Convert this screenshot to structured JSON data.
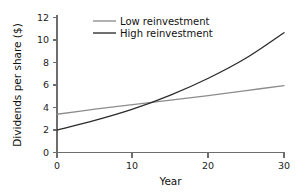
{
  "figure": {
    "width": 308,
    "height": 193,
    "background": "#ffffff"
  },
  "chart_data": {
    "type": "line",
    "title": "",
    "subtitle": "",
    "xlabel": "Year",
    "ylabel": "Dividends per share ($)",
    "xlim": [
      0,
      30
    ],
    "ylim": [
      0,
      12
    ],
    "xticks": [
      0,
      10,
      20,
      30
    ],
    "xtick_labels": [
      "0",
      "10",
      "20",
      "30"
    ],
    "yticks": [
      0,
      2,
      4,
      6,
      8,
      10,
      12
    ],
    "ytick_labels": [
      "0",
      "2",
      "4",
      "6",
      "8",
      "10",
      "12"
    ],
    "grid": false,
    "legend_position": "top-center",
    "series": [
      {
        "name": "Low reinvestment",
        "color": "#8c8c8c",
        "line_width": 1.3,
        "x": [
          0,
          5,
          10,
          15,
          20,
          25,
          30
        ],
        "values": [
          3.4,
          3.85,
          4.25,
          4.65,
          5.05,
          5.5,
          5.95
        ]
      },
      {
        "name": "High reinvestment",
        "color": "#2b2b2b",
        "line_width": 1.3,
        "x": [
          0,
          5,
          10,
          15,
          20,
          25,
          30
        ],
        "values": [
          2.0,
          2.85,
          3.85,
          5.1,
          6.6,
          8.4,
          10.65
        ]
      }
    ],
    "annotations": [
      {
        "label": "crossover",
        "x": 13.6,
        "y": 4.55
      }
    ]
  },
  "axes": {
    "y_axis_title": "Dividends per share ($)",
    "x_axis_title": "Year",
    "axis_color": "#6d6d6d",
    "tick_text_color": "#232323"
  },
  "legend": {
    "entries": [
      {
        "label": "Low reinvestment",
        "color": "#8c8c8c"
      },
      {
        "label": "High reinvestment",
        "color": "#2b2b2b"
      }
    ]
  }
}
